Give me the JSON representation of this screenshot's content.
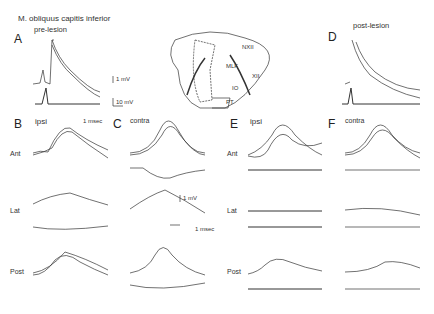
{
  "figure": {
    "title": "M. obliquus capitis inferior",
    "pre_lesion": "pre-lesion",
    "post_lesion": "post-lesion",
    "panels": {
      "A": "A",
      "B": "B",
      "C": "C",
      "D": "D",
      "E": "E",
      "F": "F"
    },
    "conditions": {
      "B": "ipsi",
      "C": "contra",
      "E": "ipsi",
      "F": "contra"
    },
    "rows": [
      "Ant",
      "Lat",
      "Post"
    ],
    "scale_bars": {
      "a_small": "1 mV",
      "a_large": "10 mV",
      "a_time": "1 msec",
      "c_volt": "1 mV",
      "c_time": "1 msec"
    },
    "brainstem_labels": [
      "NXII",
      "MLF",
      "XII",
      "IO",
      "PT"
    ]
  }
}
